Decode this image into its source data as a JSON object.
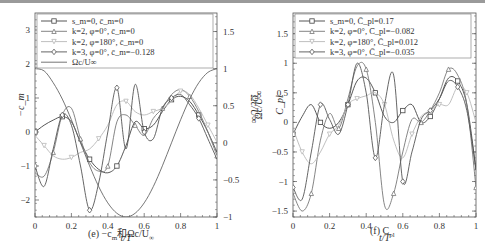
{
  "chart_data": [
    {
      "type": "line",
      "panel": "e",
      "caption": "(e) −c_m和Ωc/U∞",
      "xlabel": "t/T",
      "ylabel": "−c_m",
      "ylabel_right": "Ωc/U∞",
      "xlim": [
        0,
        1
      ],
      "ylim": [
        -2.5,
        3.5
      ],
      "ylim_right": [
        -1,
        1.75
      ],
      "xticks": [
        "0",
        "0.2",
        "0.4",
        "0.6",
        "0.8",
        "1"
      ],
      "yticks": [
        "-2",
        "-1",
        "0",
        "1",
        "2",
        "3"
      ],
      "yticks_right": [
        "-1",
        "-0.5",
        "0",
        "0.5",
        "1",
        "1.5"
      ],
      "legend": [
        "s_m=0, c̄_m=0",
        "k=2, φ=0°, c̄_m=0",
        "k=2, φ=180°, c̄_m=0",
        "k=3, φ=0°, c̄_m=−0.128",
        "Ωc/U∞"
      ],
      "x": [
        0,
        0.05,
        0.1,
        0.15,
        0.2,
        0.25,
        0.3,
        0.35,
        0.4,
        0.45,
        0.5,
        0.55,
        0.6,
        0.65,
        0.7,
        0.75,
        0.8,
        0.85,
        0.9,
        0.95,
        1.0
      ],
      "series": [
        {
          "name": "s_m=0, c̄_m=0",
          "marker": "square",
          "color": "#444444",
          "values": [
            0.0,
            0.2,
            0.35,
            0.45,
            0.3,
            -0.3,
            -0.8,
            -1.1,
            -1.2,
            -1.0,
            -0.4,
            0.3,
            0.1,
            0.2,
            0.6,
            0.95,
            1.05,
            0.9,
            0.5,
            0.0,
            -0.6
          ]
        },
        {
          "name": "k=2, φ=0°, c̄_m=0",
          "marker": "triangle",
          "color": "#777777",
          "values": [
            -1.2,
            -1.3,
            -0.6,
            0.5,
            0.7,
            -0.2,
            -0.9,
            -1.15,
            -1.0,
            0.3,
            0.5,
            0.2,
            -0.1,
            0.4,
            0.7,
            1.1,
            1.25,
            1.05,
            0.6,
            0.0,
            -0.7
          ]
        },
        {
          "name": "k=2, φ=180°, c̄_m=0",
          "marker": "inverted-triangle",
          "color": "#b8b8b8",
          "values": [
            -0.1,
            -0.4,
            -0.7,
            -0.8,
            -0.75,
            -0.6,
            -0.5,
            -0.2,
            0.2,
            0.8,
            0.9,
            0.6,
            0.5,
            0.6,
            0.7,
            0.9,
            1.2,
            1.1,
            0.7,
            0.2,
            -0.3
          ]
        },
        {
          "name": "k=3, φ=0°, c̄_m=−0.128",
          "marker": "diamond",
          "color": "#555555",
          "values": [
            -1.0,
            -1.6,
            -0.5,
            0.5,
            0.2,
            -1.0,
            -2.3,
            -1.5,
            0.0,
            1.3,
            -0.5,
            1.4,
            0.0,
            -0.2,
            0.7,
            1.0,
            1.1,
            0.8,
            0.4,
            -0.2,
            -0.8
          ]
        },
        {
          "name": "Ωc/U∞",
          "marker": "none",
          "color": "#666666",
          "axis": "right",
          "values": [
            1.0,
            0.97,
            0.81,
            0.59,
            0.31,
            0.0,
            -0.31,
            -0.59,
            -0.81,
            -0.95,
            -1.0,
            -0.95,
            -0.81,
            -0.59,
            -0.31,
            0.0,
            0.31,
            0.59,
            0.81,
            0.95,
            1.0
          ]
        }
      ]
    },
    {
      "type": "line",
      "panel": "f",
      "caption": "(f) C_pl",
      "xlabel": "t/T",
      "ylabel": "C_pl",
      "xlim": [
        0,
        1
      ],
      "ylim": [
        -1.6,
        1.85
      ],
      "xticks": [
        "0",
        "0.2",
        "0.4",
        "0.6",
        "0.8",
        "1"
      ],
      "yticks": [
        "-1.5",
        "-1",
        "-0.5",
        "0",
        "0.5",
        "1",
        "1.5"
      ],
      "legend": [
        "s_m=0, C̄_pl=0.17",
        "k=2, φ=0°, C̄_pl=−0.082",
        "k=2, φ=180°, C̄_pl=0.012",
        "k=3, φ=0°, C̄_pl=−0.035"
      ],
      "x": [
        0,
        0.05,
        0.1,
        0.15,
        0.2,
        0.25,
        0.3,
        0.35,
        0.4,
        0.45,
        0.5,
        0.55,
        0.6,
        0.65,
        0.7,
        0.75,
        0.8,
        0.85,
        0.9,
        0.95,
        1.0
      ],
      "series": [
        {
          "name": "s_m=0, C̄_pl=0.17",
          "marker": "square",
          "color": "#444444",
          "values": [
            -0.2,
            0.1,
            0.3,
            0.0,
            -0.1,
            0.0,
            0.3,
            0.7,
            0.75,
            0.5,
            0.1,
            0.0,
            0.2,
            0.3,
            0.0,
            0.1,
            0.4,
            0.75,
            0.7,
            0.3,
            -0.8
          ]
        },
        {
          "name": "k=2, φ=0°, C̄_pl=−0.082",
          "marker": "triangle",
          "color": "#777777",
          "values": [
            -1.2,
            -1.5,
            -1.2,
            -0.3,
            0.15,
            -0.1,
            0.4,
            0.95,
            0.9,
            0.0,
            -1.4,
            -1.2,
            -0.5,
            0.05,
            0.0,
            0.2,
            0.5,
            0.9,
            0.8,
            0.3,
            -1.1
          ]
        },
        {
          "name": "k=2, φ=180°, C̄_pl=0.012",
          "marker": "inverted-triangle",
          "color": "#b8b8b8",
          "values": [
            -0.1,
            -0.5,
            -0.7,
            -0.5,
            -0.2,
            -0.05,
            0.3,
            0.4,
            0.45,
            0.5,
            0.3,
            -0.3,
            -0.6,
            -0.2,
            0.1,
            0.2,
            0.3,
            0.3,
            0.6,
            0.5,
            0.0
          ]
        },
        {
          "name": "k=3, φ=0°, C̄_pl=−0.035",
          "marker": "diamond",
          "color": "#555555",
          "values": [
            -1.1,
            -1.3,
            -0.5,
            0.3,
            0.05,
            -0.2,
            0.3,
            1.0,
            0.5,
            -0.6,
            0.3,
            0.8,
            -1.0,
            -0.5,
            0.05,
            0.2,
            0.4,
            0.7,
            0.6,
            0.2,
            -0.8
          ]
        }
      ]
    }
  ],
  "captions": {
    "left": "(e)  −c",
    "left_sub_m": "m",
    "left_rest": "和Ωc/U",
    "left_sub_inf": "∞",
    "right": "(f)  C",
    "right_sub": "pl"
  },
  "axes": {
    "xlabel": "t/T"
  }
}
